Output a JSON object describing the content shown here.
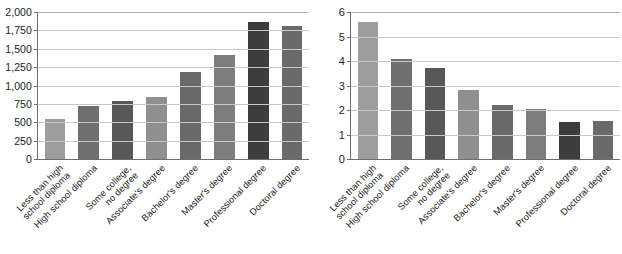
{
  "chart_data": [
    {
      "type": "bar",
      "panel": "left",
      "title": "",
      "xlabel": "",
      "ylabel": "",
      "ylim": [
        0,
        2000
      ],
      "ytick_step": 250,
      "grid": true,
      "legend": "none",
      "ytick_labels": [
        "0",
        "250",
        "500",
        "750",
        "1,000",
        "1,250",
        "1,500",
        "1,750",
        "2,000"
      ],
      "ytick_values": [
        0,
        250,
        500,
        750,
        1000,
        1250,
        1500,
        1750,
        2000
      ],
      "categories": [
        "Less than high\nschool diploma",
        "High school diploma",
        "Some college,\nno degree",
        "Associate's degree",
        "Bachelor's degree",
        "Master's degree",
        "Professional degree",
        "Doctoral degree"
      ],
      "values": [
        540,
        720,
        790,
        845,
        1180,
        1415,
        1870,
        1805
      ],
      "bar_colors": [
        "#9d9d9d",
        "#6f6f6f",
        "#585858",
        "#8f8f8f",
        "#6a6a6a",
        "#7d7d7d",
        "#3d3d3d",
        "#6a6a6a"
      ]
    },
    {
      "type": "bar",
      "panel": "right",
      "title": "",
      "xlabel": "",
      "ylabel": "",
      "ylim": [
        0,
        6
      ],
      "ytick_step": 1,
      "grid": true,
      "legend": "none",
      "ytick_labels": [
        "0",
        "1",
        "2",
        "3",
        "4",
        "5",
        "6"
      ],
      "ytick_values": [
        0,
        1,
        2,
        3,
        4,
        5,
        6
      ],
      "categories": [
        "Less than high\nschool diploma",
        "High school diploma",
        "Some college,\nno degree",
        "Associate's degree",
        "Bachelor's degree",
        "Master's degree",
        "Professional degree",
        "Doctoral degree"
      ],
      "values": [
        5.6,
        4.1,
        3.7,
        2.8,
        2.2,
        2.05,
        1.5,
        1.55
      ],
      "bar_colors": [
        "#9d9d9d",
        "#6f6f6f",
        "#585858",
        "#8f8f8f",
        "#6a6a6a",
        "#7d7d7d",
        "#3d3d3d",
        "#6a6a6a"
      ]
    }
  ]
}
